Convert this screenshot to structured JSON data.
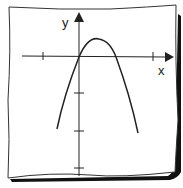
{
  "diagram": {
    "axes": {
      "x_label": "x",
      "y_label": "y"
    },
    "curve": {
      "type": "parabola",
      "opens": "down",
      "passes_through_origin": true
    },
    "colors": {
      "ink": "#222222",
      "paper": "#ffffff",
      "shadow": "#111111"
    }
  }
}
